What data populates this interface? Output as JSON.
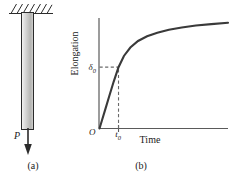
{
  "figure": {
    "panel_a": {
      "caption": "(a)",
      "load_label": "P",
      "support_icon": "fixed-support-hatch-icon",
      "bar_icon": "prismatic-bar-icon",
      "arrow_icon": "down-arrow-icon",
      "bar_fill_color": "#c6c6c4",
      "outline_color": "#2b2b2b"
    },
    "panel_b": {
      "caption": "(b)",
      "ylabel": "Elongation",
      "xlabel": "Time",
      "origin_label": "O",
      "y_tick_label": "δ",
      "y_tick_sub": "0",
      "x_tick_label": "t",
      "x_tick_sub": "0",
      "curve_color": "#3a3a3a",
      "axis_color": "#5a5a5a",
      "dashed_color": "#6a6a6a"
    }
  },
  "chart_data": {
    "type": "line",
    "title": "",
    "xlabel": "Time",
    "ylabel": "Elongation",
    "xlim": [
      0,
      1
    ],
    "ylim": [
      0,
      1
    ],
    "grid": false,
    "legend": null,
    "annotations": [
      {
        "name": "origin",
        "label": "O",
        "x": 0,
        "y": 0
      },
      {
        "name": "initial-elongation",
        "label": "δ0",
        "x": 0,
        "y": 0.545
      },
      {
        "name": "load-time",
        "label": "t0",
        "x": 0.148,
        "y": 0
      }
    ],
    "series": [
      {
        "name": "creep-curve",
        "x": [
          0.0,
          0.02,
          0.045,
          0.075,
          0.11,
          0.148,
          0.19,
          0.24,
          0.3,
          0.37,
          0.45,
          0.54,
          0.64,
          0.75,
          0.87,
          1.0
        ],
        "y": [
          0.0,
          0.075,
          0.17,
          0.285,
          0.415,
          0.545,
          0.645,
          0.72,
          0.778,
          0.82,
          0.852,
          0.878,
          0.898,
          0.915,
          0.928,
          0.94
        ]
      }
    ],
    "dashed_guides": [
      {
        "name": "delta0-horizontal",
        "from": [
          0,
          0.545
        ],
        "to": [
          0.148,
          0.545
        ]
      },
      {
        "name": "t0-vertical",
        "from": [
          0.148,
          0
        ],
        "to": [
          0.148,
          0.545
        ]
      }
    ]
  }
}
